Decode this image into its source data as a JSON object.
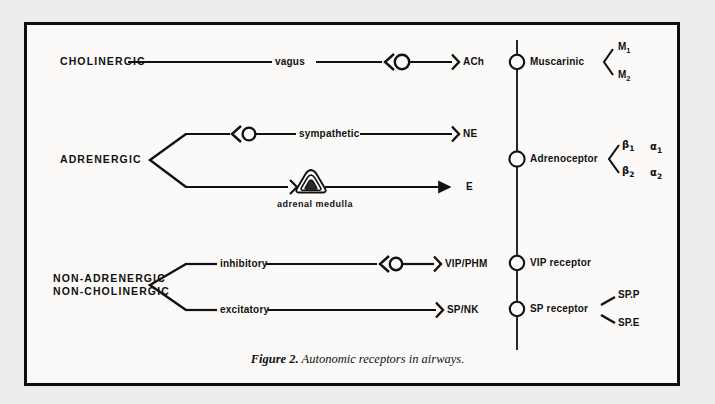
{
  "figure": {
    "caption_prefix": "Figure 2.",
    "caption_text": "Autonomic receptors in airways.",
    "ink_color": "#111111",
    "paper_color": "#fbfaf8",
    "page_color": "#edecea"
  },
  "pathways": [
    {
      "id": "cholinergic",
      "name": "CHOLINERGIC",
      "nerves": [
        {
          "id": "vagus",
          "name": "vagus",
          "ganglion": true,
          "arrow": "chevron",
          "transmitter": "ACh"
        }
      ]
    },
    {
      "id": "adrenergic",
      "name": "ADRENERGIC",
      "branching": true,
      "nerves": [
        {
          "id": "sympathetic",
          "name": "sympathetic",
          "ganglion": true,
          "arrow": "chevron",
          "transmitter": "NE"
        },
        {
          "id": "adrenal",
          "name": "",
          "organ": "adrenal medulla",
          "ganglion": false,
          "arrow": "solid",
          "transmitter": "E"
        }
      ]
    },
    {
      "id": "nanc",
      "name_line1": "NON-ADRENERGIC",
      "name_line2": "NON-CHOLINERGIC",
      "branching": true,
      "nerves": [
        {
          "id": "inhibitory",
          "name": "inhibitory",
          "ganglion": true,
          "arrow": "chevron",
          "transmitter": "VIP/PHM"
        },
        {
          "id": "excitatory",
          "name": "excitatory",
          "ganglion": false,
          "arrow": "chevron",
          "transmitter": "SP/NK"
        }
      ]
    }
  ],
  "receptors": [
    {
      "id": "muscarinic",
      "name": "Muscarinic",
      "subtype_style": "chevron",
      "subtypes": [
        [
          "M",
          "1"
        ],
        [
          "M",
          "2"
        ]
      ]
    },
    {
      "id": "adrenoceptor",
      "name": "Adrenoceptor",
      "subtype_style": "chevron",
      "subtypes_col1": [
        [
          "β",
          "1"
        ],
        [
          "β",
          "2"
        ]
      ],
      "subtypes_col2": [
        [
          "α",
          "1"
        ],
        [
          "α",
          "2"
        ]
      ]
    },
    {
      "id": "vip-receptor",
      "name": "VIP receptor",
      "subtype_style": "none",
      "subtypes": []
    },
    {
      "id": "sp-receptor",
      "name": "SP receptor",
      "subtype_style": "ticks",
      "subtypes_plain": [
        "SP.P",
        "SP.E"
      ]
    }
  ],
  "labels": {
    "cholinergic": "CHOLINERGIC",
    "adrenergic": "ADRENERGIC",
    "nanc_line1": "NON-ADRENERGIC",
    "nanc_line2": "NON-CHOLINERGIC",
    "vagus": "vagus",
    "sympathetic": "sympathetic",
    "inhibitory": "inhibitory",
    "excitatory": "excitatory",
    "adrenal_medulla": "adrenal medulla",
    "ach": "ACh",
    "ne": "NE",
    "e": "E",
    "vip_phm": "VIP/PHM",
    "sp_nk": "SP/NK",
    "muscarinic": "Muscarinic",
    "adrenoceptor": "Adrenoceptor",
    "vip_receptor": "VIP receptor",
    "sp_receptor": "SP receptor",
    "m1": "M",
    "m1sub": "1",
    "m2": "M",
    "m2sub": "2",
    "beta1": "β",
    "beta1sub": "1",
    "beta2": "β",
    "beta2sub": "2",
    "alpha1": "α",
    "alpha1sub": "1",
    "alpha2": "β",
    "alpha1char": "α",
    "alpha2char": "α",
    "alpha2sub": "2",
    "sp_p": "SP.P",
    "sp_e": "SP.E"
  }
}
